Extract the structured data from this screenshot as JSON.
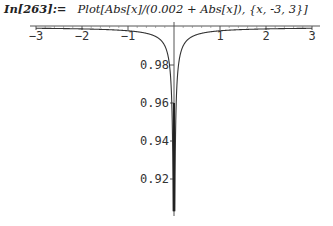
{
  "input": {
    "label": "In[263]:=",
    "command": "Plot[Abs[x]/(0.002 + Abs[x]), {x, -3, 3}]"
  },
  "chart_data": {
    "type": "line",
    "title": "",
    "function": "Abs[x]/(0.002 + Abs[x])",
    "xlabel": "",
    "ylabel": "",
    "xlim": [
      -3,
      3
    ],
    "ylim": [
      0.903,
      1.0
    ],
    "x_ticks": [
      -3,
      -2,
      -1,
      1,
      2,
      3
    ],
    "x_tick_labels": [
      "-3",
      "-2",
      "-1",
      "1",
      "2",
      "3"
    ],
    "y_ticks": [
      0.92,
      0.94,
      0.96,
      0.98
    ],
    "y_tick_labels": [
      "0.92",
      "0.94",
      "0.96",
      "0.98"
    ],
    "grid": false,
    "legend": null,
    "series": [
      {
        "name": "Abs[x]/(0.002 + Abs[x])",
        "x": [
          -3,
          -2,
          -1,
          -0.5,
          -0.2,
          -0.1,
          -0.05,
          -0.03,
          -0.02,
          -0.019,
          0.019,
          0.02,
          0.03,
          0.05,
          0.1,
          0.2,
          0.5,
          1,
          2,
          3
        ],
        "values": [
          0.9993,
          0.999,
          0.998,
          0.996,
          0.99,
          0.98,
          0.962,
          0.9375,
          0.909,
          0.905,
          0.905,
          0.909,
          0.9375,
          0.962,
          0.98,
          0.99,
          0.996,
          0.998,
          0.999,
          0.9993
        ]
      }
    ]
  }
}
